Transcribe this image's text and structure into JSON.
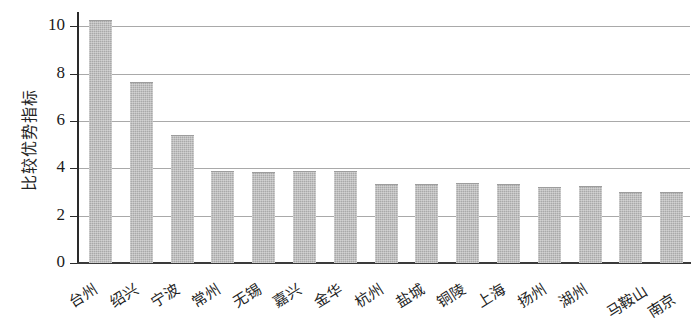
{
  "chart_data": {
    "type": "bar",
    "title": "",
    "xlabel": "",
    "ylabel": "比较优势指标",
    "ylim": [
      0,
      10.6
    ],
    "yticks": [
      0,
      2,
      4,
      6,
      8,
      10
    ],
    "ytick_labels": [
      "0",
      "2",
      "4",
      "6",
      "8",
      "10"
    ],
    "grid": true,
    "legend": "none",
    "bar_color": "#a9a9a9",
    "axis_color": "#2a2a2a",
    "categories": [
      "台州",
      "绍兴",
      "宁波",
      "常州",
      "无锡",
      "嘉兴",
      "金华",
      "杭州",
      "盐城",
      "铜陵",
      "上海",
      "扬州",
      "湖州",
      "马鞍山",
      "南京"
    ],
    "values": [
      10.2,
      7.6,
      5.35,
      3.85,
      3.8,
      3.85,
      3.85,
      3.3,
      3.3,
      3.35,
      3.3,
      3.15,
      3.2,
      2.95,
      2.95
    ]
  }
}
